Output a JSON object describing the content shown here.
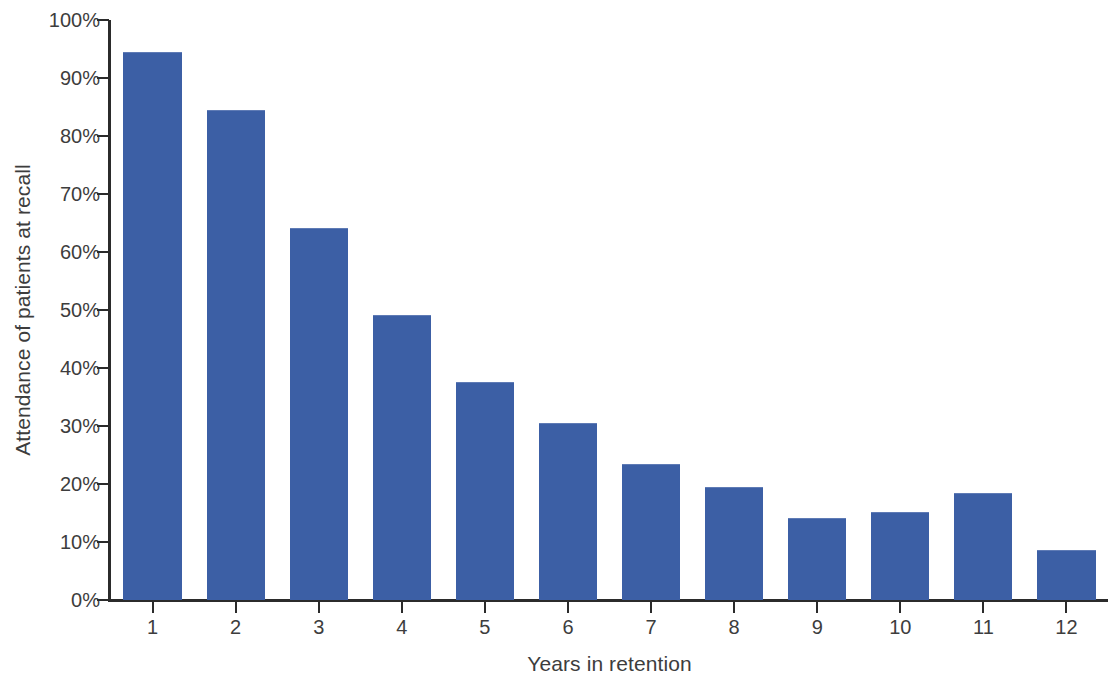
{
  "chart_data": {
    "type": "bar",
    "title": "",
    "xlabel": "Years in retention",
    "ylabel": "Attendance of patients at recall",
    "categories": [
      "1",
      "2",
      "3",
      "4",
      "5",
      "6",
      "7",
      "8",
      "9",
      "10",
      "11",
      "12"
    ],
    "values": [
      94.5,
      84.5,
      64.2,
      49.1,
      37.6,
      30.5,
      23.4,
      19.4,
      14.2,
      15.2,
      18.4,
      8.6
    ],
    "value_labels": [
      "94.5%",
      "84.5%",
      "64.2%",
      "49.1%",
      "37.6%",
      "30.5%",
      "23.4%",
      "19.4%",
      "14.2%",
      "15.2%",
      "18.4%",
      "8.6%"
    ],
    "ylim": [
      0,
      100
    ],
    "ytick_values": [
      0,
      10,
      20,
      30,
      40,
      50,
      60,
      70,
      80,
      90,
      100
    ],
    "ytick_labels": [
      "0%",
      "10%",
      "20%",
      "30%",
      "40%",
      "50%",
      "60%",
      "70%",
      "80%",
      "90%",
      "100%"
    ],
    "grid": false,
    "legend": null,
    "bar_color": "#3c5fa5",
    "axis_color": "#2b2b2b",
    "text_color": "#3d3d3d",
    "background_color": "#ffffff"
  }
}
